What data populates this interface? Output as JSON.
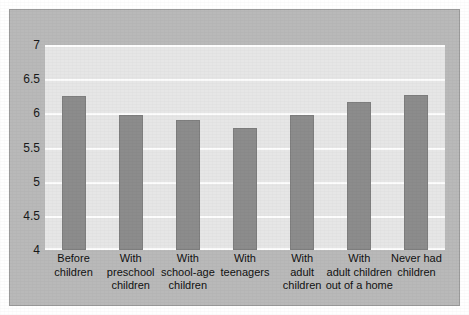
{
  "chart_data": {
    "type": "bar",
    "title": "",
    "subtitle": "",
    "xlabel": "",
    "ylabel": "",
    "ylim": [
      4,
      7
    ],
    "grid": true,
    "legend": "none",
    "categories": [
      "Before\nchildren",
      "With\npreschool\nchildren",
      "With\nschool-age\nchildren",
      "With\nteenagers",
      "With\nadult\nchildren",
      "With\nadult children\nout of a home",
      "Never had\nchildren"
    ],
    "values": [
      6.25,
      5.97,
      5.9,
      5.78,
      5.97,
      6.16,
      6.27
    ],
    "ytick_labels": [
      "7",
      "6.5",
      "6",
      "5.5",
      "5",
      "4.5",
      "4"
    ],
    "ytick_values": [
      7,
      6.5,
      6,
      5.5,
      5,
      4.5,
      4
    ]
  },
  "colors": {
    "bar": "#8c8c8c",
    "bar_border": "#7e7e7e",
    "plot_background": "#e6e6e6",
    "frame_background": "#b9b9b9",
    "gridline": "#fdfdfd",
    "text": "#111111",
    "page_background": "#ffffff"
  }
}
